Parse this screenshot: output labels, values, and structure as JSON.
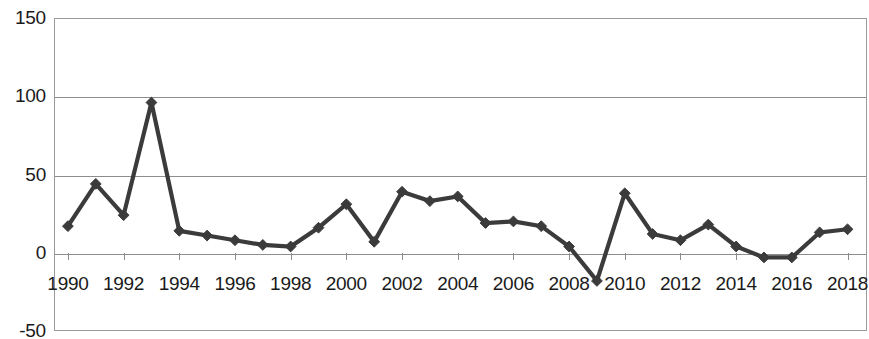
{
  "chart_data": {
    "type": "line",
    "title": "",
    "xlabel": "",
    "ylabel": "",
    "x": [
      1990,
      1991,
      1992,
      1993,
      1994,
      1995,
      1996,
      1997,
      1998,
      1999,
      2000,
      2001,
      2002,
      2003,
      2004,
      2005,
      2006,
      2007,
      2008,
      2009,
      2010,
      2011,
      2012,
      2013,
      2014,
      2015,
      2016,
      2017,
      2018
    ],
    "values": [
      17,
      44,
      24,
      96,
      14,
      11,
      8,
      5,
      4,
      16,
      31,
      7,
      39,
      33,
      36,
      19,
      20,
      17,
      4,
      -18,
      38,
      12,
      8,
      18,
      4,
      -3,
      -3,
      13,
      15
    ],
    "series": [
      {
        "name": "series-1",
        "values": [
          17,
          44,
          24,
          96,
          14,
          11,
          8,
          5,
          4,
          16,
          31,
          7,
          39,
          33,
          36,
          19,
          20,
          17,
          4,
          -18,
          38,
          12,
          8,
          18,
          4,
          -3,
          -3,
          13,
          15
        ]
      }
    ],
    "xlim": [
      1989.5,
      2018.7
    ],
    "ylim": [
      -50,
      150
    ],
    "ytick_values": [
      150,
      100,
      50,
      0,
      -50
    ],
    "ytick_labels": [
      "150",
      "100",
      "50",
      "0",
      "-50"
    ],
    "xtick_values": [
      1990,
      1992,
      1994,
      1996,
      1998,
      2000,
      2002,
      2004,
      2006,
      2008,
      2010,
      2012,
      2014,
      2016,
      2018
    ],
    "xtick_labels": [
      "1990",
      "1992",
      "1994",
      "1996",
      "1998",
      "2000",
      "2002",
      "2004",
      "2006",
      "2008",
      "2010",
      "2012",
      "2014",
      "2016",
      "2018"
    ],
    "grid": true,
    "grid_axis": "y",
    "legend": false,
    "legend_position": "none",
    "marker": "diamond",
    "colors": {
      "line": "#3b3b3b",
      "marker": "#3b3b3b",
      "grid": "#8d8d8d",
      "frame": "#9a9a9a",
      "text": "#1a1a1a",
      "background": "#ffffff"
    }
  }
}
